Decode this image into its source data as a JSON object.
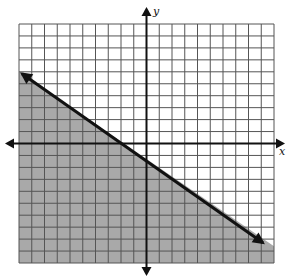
{
  "chart_data": {
    "type": "area",
    "title": "",
    "subtitle": "Graph of a linear inequality with shaded half-plane",
    "xlabel": "x",
    "ylabel": "y",
    "xlim": [
      -10,
      10
    ],
    "ylim": [
      -10,
      10
    ],
    "grid": true,
    "grid_step": 1,
    "tick_labels": false,
    "legend": null,
    "boundary_line": {
      "style": "solid",
      "arrows": "both",
      "points": [
        {
          "x": -10,
          "y": 6
        },
        {
          "x": 9.6,
          "y": -8.3
        }
      ],
      "approx_equation": "y = -0.73x - 1.3"
    },
    "shaded_region": "below the line",
    "shading_color": "#a9a9a9",
    "line_color": "#111111",
    "grid_color": "#555555",
    "background_color": "#ffffff"
  },
  "labels": {
    "x_axis": "x",
    "y_axis": "y"
  }
}
